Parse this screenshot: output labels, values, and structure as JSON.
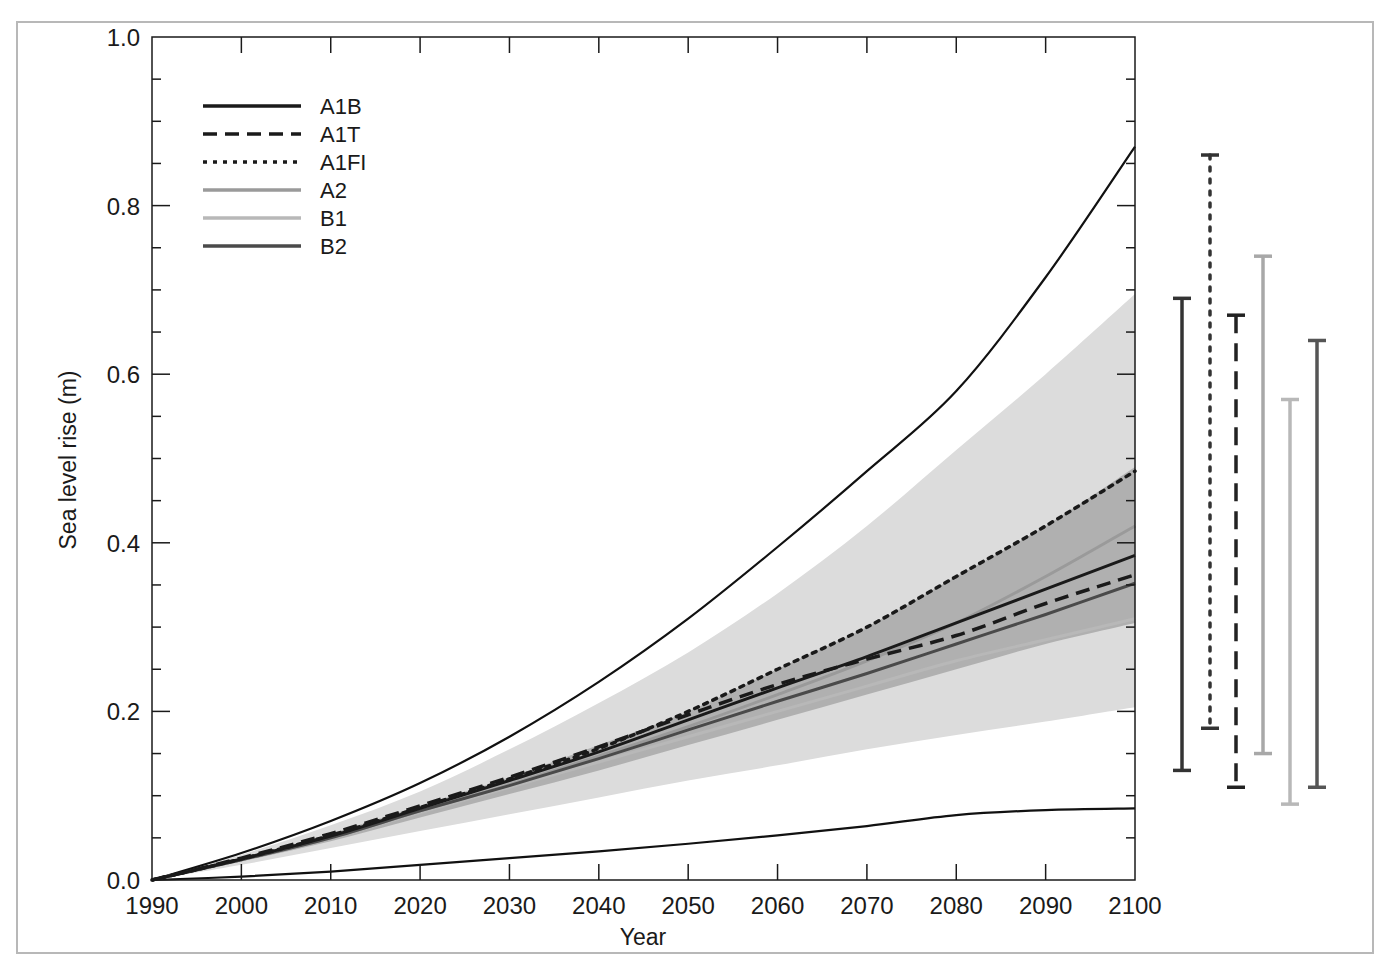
{
  "chart_data": {
    "type": "line",
    "title": "",
    "xlabel": "Year",
    "ylabel": "Sea level rise (m)",
    "xlim": [
      1990,
      2100
    ],
    "ylim": [
      0.0,
      1.0
    ],
    "x_ticks": [
      "1990",
      "2000",
      "2010",
      "2020",
      "2030",
      "2040",
      "2050",
      "2060",
      "2070",
      "2080",
      "2090",
      "2100"
    ],
    "y_ticks": [
      "0.0",
      "0.2",
      "0.4",
      "0.6",
      "0.8",
      "1.0"
    ],
    "grid": false,
    "legend_position": "upper left",
    "x": [
      1990,
      2000,
      2010,
      2020,
      2030,
      2040,
      2050,
      2060,
      2070,
      2080,
      2090,
      2100
    ],
    "series": [
      {
        "name": "A1B",
        "style": "solid",
        "color": "#1a1a1a",
        "values": [
          0.0,
          0.025,
          0.052,
          0.085,
          0.118,
          0.152,
          0.19,
          0.228,
          0.265,
          0.305,
          0.345,
          0.385
        ]
      },
      {
        "name": "A1T",
        "style": "dashed",
        "color": "#1a1a1a",
        "values": [
          0.0,
          0.026,
          0.055,
          0.088,
          0.122,
          0.158,
          0.196,
          0.232,
          0.262,
          0.29,
          0.328,
          0.362
        ]
      },
      {
        "name": "A1FI",
        "style": "dotted",
        "color": "#1a1a1a",
        "values": [
          0.0,
          0.025,
          0.053,
          0.086,
          0.12,
          0.156,
          0.2,
          0.25,
          0.3,
          0.36,
          0.42,
          0.485
        ]
      },
      {
        "name": "A2",
        "style": "solid",
        "color": "#9a9a9a",
        "values": [
          0.0,
          0.024,
          0.05,
          0.082,
          0.113,
          0.147,
          0.182,
          0.22,
          0.26,
          0.305,
          0.36,
          0.42
        ]
      },
      {
        "name": "B1",
        "style": "solid",
        "color": "#b8b8b8",
        "values": [
          0.0,
          0.024,
          0.05,
          0.08,
          0.11,
          0.14,
          0.17,
          0.2,
          0.23,
          0.26,
          0.285,
          0.31
        ]
      },
      {
        "name": "B2",
        "style": "solid",
        "color": "#4a4a4a",
        "values": [
          0.0,
          0.024,
          0.05,
          0.082,
          0.112,
          0.144,
          0.178,
          0.212,
          0.245,
          0.28,
          0.315,
          0.352
        ]
      }
    ],
    "envelopes": [
      {
        "name": "outer-light-envelope",
        "color": "#dcdcdc",
        "lower": [
          0.0,
          0.018,
          0.038,
          0.058,
          0.078,
          0.098,
          0.118,
          0.136,
          0.155,
          0.172,
          0.188,
          0.205
        ],
        "upper": [
          0.0,
          0.03,
          0.065,
          0.105,
          0.155,
          0.21,
          0.27,
          0.34,
          0.42,
          0.51,
          0.6,
          0.695
        ]
      },
      {
        "name": "inner-dark-envelope",
        "color": "#b0b0b0",
        "lower": [
          0.0,
          0.022,
          0.046,
          0.074,
          0.102,
          0.13,
          0.16,
          0.19,
          0.22,
          0.25,
          0.28,
          0.305
        ],
        "upper": [
          0.0,
          0.026,
          0.055,
          0.088,
          0.122,
          0.16,
          0.2,
          0.25,
          0.3,
          0.36,
          0.42,
          0.49
        ]
      }
    ],
    "bounding_curves": [
      {
        "name": "upper-bound",
        "values": [
          0.0,
          0.032,
          0.07,
          0.115,
          0.17,
          0.235,
          0.31,
          0.395,
          0.485,
          0.58,
          0.715,
          0.87
        ]
      },
      {
        "name": "lower-bound",
        "values": [
          0.0,
          0.004,
          0.01,
          0.018,
          0.026,
          0.034,
          0.043,
          0.053,
          0.064,
          0.077,
          0.083,
          0.085
        ]
      }
    ],
    "range_bars_2100": [
      {
        "name": "A1B",
        "style": "solid",
        "color": "#333333",
        "low": 0.13,
        "high": 0.69
      },
      {
        "name": "A1FI",
        "style": "dotted",
        "color": "#333333",
        "low": 0.18,
        "high": 0.86
      },
      {
        "name": "A1T",
        "style": "dashed",
        "color": "#222222",
        "low": 0.11,
        "high": 0.67
      },
      {
        "name": "A2",
        "style": "solid",
        "color": "#a8a8a8",
        "low": 0.15,
        "high": 0.74
      },
      {
        "name": "B1",
        "style": "solid",
        "color": "#b8b8b8",
        "low": 0.09,
        "high": 0.57
      },
      {
        "name": "B2",
        "style": "solid",
        "color": "#555555",
        "low": 0.11,
        "high": 0.64
      }
    ]
  },
  "legend": {
    "items": [
      {
        "label": "A1B"
      },
      {
        "label": "A1T"
      },
      {
        "label": "A1FI"
      },
      {
        "label": "A2"
      },
      {
        "label": "B1"
      },
      {
        "label": "B2"
      }
    ]
  },
  "axes": {
    "x_title": "Year",
    "y_title": "Sea level rise (m)",
    "x_ticks": [
      "1990",
      "2000",
      "2010",
      "2020",
      "2030",
      "2040",
      "2050",
      "2060",
      "2070",
      "2080",
      "2090",
      "2100"
    ],
    "y_ticks": [
      "0.0",
      "0.2",
      "0.4",
      "0.6",
      "0.8",
      "1.0"
    ]
  }
}
